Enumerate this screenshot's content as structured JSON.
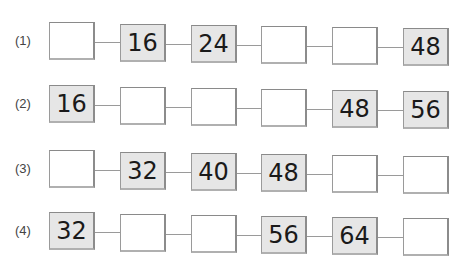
{
  "worksheet": {
    "problems": [
      {
        "label": "(1)",
        "cells": [
          "",
          "16",
          "24",
          "",
          "",
          "48"
        ]
      },
      {
        "label": "(2)",
        "cells": [
          "16",
          "",
          "",
          "",
          "48",
          "56"
        ]
      },
      {
        "label": "(3)",
        "cells": [
          "",
          "32",
          "40",
          "48",
          "",
          ""
        ]
      },
      {
        "label": "(4)",
        "cells": [
          "32",
          "",
          "",
          "56",
          "64",
          ""
        ]
      }
    ]
  },
  "colors": {
    "filled_box": "#e6e6e6",
    "empty_box": "#ffffff",
    "border": "#9a9a9a",
    "text": "#1a1a1a"
  }
}
